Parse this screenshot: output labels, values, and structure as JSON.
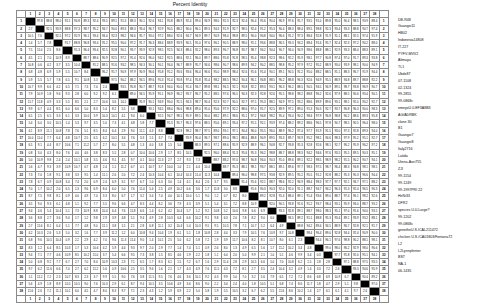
{
  "chart_data": {
    "type": "heatmap",
    "title": "Percent Identity",
    "ylabel": "Divergence",
    "xlabel": "",
    "n": 38,
    "column_labels": [
      "1",
      "2",
      "3",
      "4",
      "5",
      "6",
      "7",
      "8",
      "9",
      "10",
      "11",
      "12",
      "13",
      "14",
      "15",
      "16",
      "17",
      "18",
      "19",
      "20",
      "21",
      "22",
      "23",
      "24",
      "25",
      "26",
      "27",
      "28",
      "29",
      "30",
      "31",
      "32",
      "33",
      "34",
      "35",
      "36",
      "37",
      "38"
    ],
    "row_labels": [
      "1",
      "2",
      "3",
      "4",
      "5",
      "6",
      "7",
      "8",
      "9",
      "10",
      "11",
      "12",
      "13",
      "14",
      "15",
      "16",
      "17",
      "18",
      "19",
      "20",
      "21",
      "22",
      "23",
      "24",
      "25",
      "26",
      "27",
      "28",
      "29",
      "30",
      "31",
      "32",
      "33",
      "34",
      "35",
      "36",
      "37",
      "38"
    ],
    "sequence_names": [
      "DB-R48",
      "Guangxi11",
      "HB02",
      "Indonesia14808",
      "IT-227",
      "PYFV-MVV2",
      "Alimaya",
      "TL1",
      "Ubde87",
      "07-1108",
      "02-1324",
      "99-2855",
      "99-0868c",
      "emeyxU.0.EF3A8B3",
      "AG/ADRBK",
      "clone 30",
      "B1",
      "Guangxi7",
      "Guangxi8",
      "Italy2716",
      "Latida",
      "Utena-Aori755",
      "ZJI",
      "99-1154",
      "99-1249",
      "99-1997PRI 22",
      "HeNi33",
      "DFR2",
      "species U.U.Large?",
      "99-1202",
      "99-0868c",
      "genetheU.S.ICAL211472",
      "chicken U.S./CA01803/Fontana72",
      "L2",
      "L2Lynnplenter",
      "BST",
      "NA-1",
      "06-1435"
    ],
    "cell_note": "Upper triangle: percent identity; lower triangle: divergence; diagonal shaded black. Values approximate (illegible at source resolution).",
    "upper_base": 93.5,
    "lower_base": 6.8,
    "values_seed": 17
  }
}
